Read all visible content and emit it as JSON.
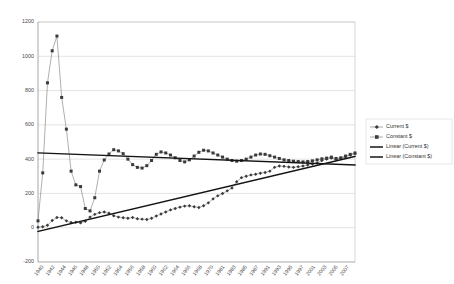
{
  "chart_data": {
    "type": "line",
    "title": "",
    "xlabel": "",
    "ylabel": "",
    "ylim": [
      -200,
      1200
    ],
    "ytick_step": 200,
    "yticks": [
      "1200",
      "1000",
      "800",
      "600",
      "400",
      "200",
      "0",
      "-200"
    ],
    "grid": true,
    "legend_position": "right",
    "x": [
      1940,
      1941,
      1942,
      1943,
      1944,
      1945,
      1946,
      1947,
      1948,
      1949,
      1950,
      1951,
      1952,
      1953,
      1954,
      1955,
      1956,
      1957,
      1958,
      1959,
      1960,
      1961,
      1962,
      1963,
      1964,
      1965,
      1966,
      1967,
      1968,
      1969,
      1970,
      1971,
      1972,
      1973,
      1974,
      1975,
      1976,
      1977,
      1978,
      1979,
      1980,
      1981,
      1982,
      1983,
      1984,
      1985,
      1986,
      1987,
      1988,
      1989,
      1990,
      1991,
      1992,
      1993,
      1994,
      1995,
      1996,
      1997,
      1998,
      1999,
      2000,
      2001,
      2002,
      2003,
      2004,
      2005,
      2006,
      2007
    ],
    "xtick_labels": [
      "1940",
      "1942",
      "1944",
      "1946",
      "1948",
      "1950",
      "1952",
      "1954",
      "1956",
      "1958",
      "1960",
      "1962",
      "1964",
      "1966",
      "1968",
      "1970",
      "1981",
      "1983",
      "1985",
      "1987",
      "1991",
      "1993",
      "1995",
      "1997",
      "2001",
      "2003",
      "2005",
      "2007"
    ],
    "series": [
      {
        "name": "Current $",
        "marker": "diamond",
        "color": "#3a3a3a",
        "values": [
          3,
          6,
          14,
          42,
          60,
          58,
          40,
          30,
          32,
          28,
          38,
          62,
          78,
          88,
          92,
          84,
          70,
          62,
          58,
          55,
          60,
          52,
          50,
          48,
          55,
          68,
          80,
          92,
          104,
          112,
          120,
          126,
          128,
          122,
          118,
          128,
          145,
          168,
          186,
          200,
          215,
          232,
          268,
          292,
          300,
          308,
          312,
          318,
          322,
          330,
          352,
          360,
          358,
          354,
          352,
          356,
          360,
          366,
          372,
          378,
          392,
          400,
          406,
          398,
          404,
          414,
          424,
          432
        ]
      },
      {
        "name": "Constant $",
        "marker": "square",
        "color": "#3a3a3a",
        "values": [
          40,
          320,
          845,
          1032,
          1118,
          760,
          575,
          330,
          250,
          240,
          112,
          98,
          175,
          330,
          395,
          430,
          455,
          448,
          432,
          400,
          368,
          352,
          348,
          362,
          392,
          428,
          442,
          436,
          424,
          408,
          392,
          384,
          396,
          418,
          440,
          452,
          448,
          436,
          424,
          412,
          400,
          392,
          388,
          392,
          400,
          412,
          424,
          430,
          428,
          420,
          412,
          404,
          396,
          392,
          388,
          386,
          384,
          386,
          390,
          396,
          402,
          406,
          412,
          404,
          408,
          418,
          428,
          436
        ]
      }
    ],
    "trendlines": [
      {
        "name": "Linear (Current $)",
        "from": [
          1940,
          -22
        ],
        "to": [
          2007,
          416
        ]
      },
      {
        "name": "Linear (Constant $)",
        "from": [
          1940,
          436
        ],
        "to": [
          2007,
          366
        ]
      }
    ],
    "legend": [
      {
        "label": "Current $",
        "type": "marker-line",
        "marker": "diamond"
      },
      {
        "label": "Constant $",
        "type": "marker-line",
        "marker": "square"
      },
      {
        "label": "Linear (Current $)",
        "type": "thick-line"
      },
      {
        "label": "Linear (Constant $)",
        "type": "thick-line"
      }
    ]
  }
}
